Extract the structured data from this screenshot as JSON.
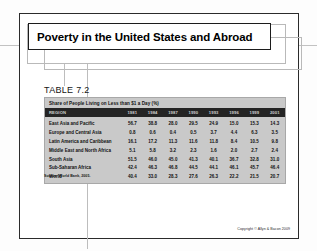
{
  "slide": {
    "title": "Poverty in the United States and Abroad",
    "table_label": "TABLE 7.2",
    "source_note": "Source: World Bank, 2005.",
    "copyright": "Copyright © Allyn & Bacon 2009"
  },
  "chart_data": {
    "type": "table",
    "title": "Share of People Living on Less than $1 a Day (%)",
    "xlabel": "",
    "ylabel": "",
    "columns": [
      "REGION",
      "1981",
      "1984",
      "1987",
      "1990",
      "1993",
      "1996",
      "1999",
      "2001"
    ],
    "categories": [
      "East Asia and Pacific",
      "Europe and Central Asia",
      "Latin America and Caribbean",
      "Middle East and North Africa",
      "South Asia",
      "Sub-Saharan Africa",
      "World"
    ],
    "series": [
      {
        "name": "1981",
        "values": [
          56.7,
          0.8,
          16.1,
          5.1,
          51.5,
          42.4,
          40.4
        ]
      },
      {
        "name": "1984",
        "values": [
          38.8,
          0.6,
          17.2,
          5.8,
          46.0,
          46.3,
          33.0
        ]
      },
      {
        "name": "1987",
        "values": [
          28.0,
          0.4,
          11.3,
          3.2,
          45.0,
          46.8,
          28.3
        ]
      },
      {
        "name": "1990",
        "values": [
          29.5,
          0.5,
          11.6,
          2.3,
          41.3,
          44.5,
          27.6
        ]
      },
      {
        "name": "1993",
        "values": [
          24.9,
          3.7,
          11.8,
          1.6,
          40.1,
          44.1,
          26.3
        ]
      },
      {
        "name": "1996",
        "values": [
          15.0,
          4.4,
          8.4,
          2.0,
          36.7,
          46.1,
          22.2
        ]
      },
      {
        "name": "1999",
        "values": [
          15.3,
          6.3,
          10.5,
          2.7,
          32.8,
          45.7,
          21.5
        ]
      },
      {
        "name": "2001",
        "values": [
          14.3,
          3.5,
          9.8,
          2.4,
          31.0,
          46.4,
          20.7
        ]
      }
    ],
    "rows": [
      {
        "region": "East Asia and Pacific",
        "values": [
          "56.7",
          "38.8",
          "28.0",
          "29.5",
          "24.9",
          "15.0",
          "15.3",
          "14.3"
        ]
      },
      {
        "region": "Europe and Central Asia",
        "values": [
          "0.8",
          "0.6",
          "0.4",
          "0.5",
          "3.7",
          "4.4",
          "6.3",
          "3.5"
        ]
      },
      {
        "region": "Latin America and Caribbean",
        "values": [
          "16.1",
          "17.2",
          "11.3",
          "11.6",
          "11.8",
          "8.4",
          "10.5",
          "9.8"
        ]
      },
      {
        "region": "Middle East and North Africa",
        "values": [
          "5.1",
          "5.8",
          "3.2",
          "2.3",
          "1.6",
          "2.0",
          "2.7",
          "2.4"
        ]
      },
      {
        "region": "South Asia",
        "values": [
          "51.5",
          "46.0",
          "45.0",
          "41.3",
          "40.1",
          "36.7",
          "32.8",
          "31.0"
        ]
      },
      {
        "region": "Sub-Saharan Africa",
        "values": [
          "42.4",
          "46.3",
          "46.8",
          "44.5",
          "44.1",
          "46.1",
          "45.7",
          "46.4"
        ]
      },
      {
        "region": "World",
        "values": [
          "40.4",
          "33.0",
          "28.3",
          "27.6",
          "26.3",
          "22.2",
          "21.5",
          "20.7"
        ]
      }
    ],
    "grid": false,
    "legend": "none"
  },
  "colors": {
    "header_band": "#242424",
    "table_body": "#c9c9c9",
    "slide_border": "#2b2b2b",
    "text": "#000000"
  }
}
